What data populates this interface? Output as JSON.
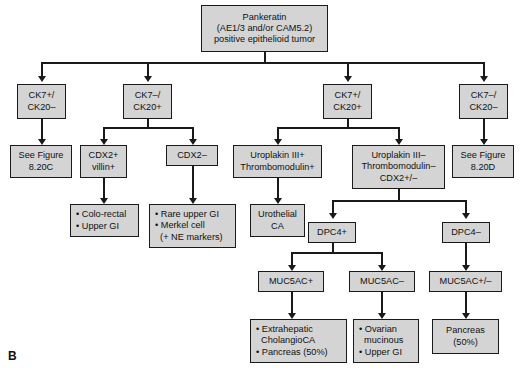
{
  "figure": {
    "panel_label": "B",
    "colors": {
      "node_fill": "#d4d4d4",
      "node_border": "#1a1a1a",
      "edge": "#1a1a1a",
      "background": "#ffffff",
      "text": "#111111"
    }
  },
  "nodes": {
    "root": {
      "id": "pankeratin",
      "lines": [
        "Pankeratin",
        "(AE1/3 and/or CAM5.2)",
        "positive epithelioid tumor"
      ]
    },
    "level2": [
      {
        "id": "ck7p-ck20n-a",
        "lines": [
          "CK7+/",
          "CK20–"
        ]
      },
      {
        "id": "ck7n-ck20p",
        "lines": [
          "CK7–/",
          "CK20+"
        ]
      },
      {
        "id": "ck7p-ck20p",
        "lines": [
          "CK7+/",
          "CK20+"
        ]
      },
      {
        "id": "ck7n-ck20n",
        "lines": [
          "CK7–/",
          "CK20–"
        ]
      }
    ],
    "level3": [
      {
        "id": "see-figure-820c",
        "lines": [
          "See Figure",
          "8.20C"
        ]
      },
      {
        "id": "cdx2-pos",
        "lines": [
          "CDX2+",
          "villin+"
        ]
      },
      {
        "id": "cdx2-neg",
        "lines": [
          "CDX2–"
        ]
      },
      {
        "id": "uroplakin-pos",
        "lines": [
          "Uroplakin III+",
          "Thrombomodulin+"
        ]
      },
      {
        "id": "uroplakin-neg",
        "lines": [
          "Uroplakin III–",
          "Thrombomodulin–",
          "CDX2+/–"
        ]
      },
      {
        "id": "see-figure-820d",
        "lines": [
          "See Figure",
          "8.20D"
        ]
      }
    ],
    "level4": [
      {
        "id": "colorectal-uppergi",
        "bullets": true,
        "lines": [
          "• Colo-rectal",
          "• Upper GI"
        ]
      },
      {
        "id": "rare-uppergi-merkel",
        "bullets": true,
        "lines": [
          "• Rare upper GI",
          "• Merkel cell",
          "  (+ NE markers)"
        ]
      },
      {
        "id": "urothelial-ca",
        "lines": [
          "Urothelial",
          "CA"
        ]
      },
      {
        "id": "dpc4-pos",
        "lines": [
          "DPC4+"
        ]
      },
      {
        "id": "dpc4-neg",
        "lines": [
          "DPC4–"
        ]
      }
    ],
    "level5": [
      {
        "id": "muc5ac-pos",
        "lines": [
          "MUC5AC+"
        ]
      },
      {
        "id": "muc5ac-neg",
        "lines": [
          "MUC5AC–"
        ]
      },
      {
        "id": "muc5ac-posneg",
        "lines": [
          "MUC5AC+/–"
        ]
      }
    ],
    "level6": [
      {
        "id": "extrahepatic-cholangio",
        "bullets": true,
        "lines": [
          "• Extrahepatic",
          "  CholangioCA",
          "• Pancreas (50%)"
        ]
      },
      {
        "id": "ovarian-mucinous",
        "bullets": true,
        "lines": [
          "• Ovarian",
          "  mucinous",
          "• Upper GI"
        ]
      },
      {
        "id": "pancreas-50",
        "lines": [
          "Pancreas",
          "(50%)"
        ]
      }
    ]
  }
}
